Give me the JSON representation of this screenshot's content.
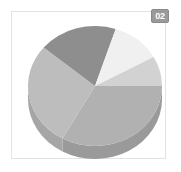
{
  "card": {
    "background_color": "#ffffff",
    "border_color": "#e3e3e3"
  },
  "badge": {
    "label": "02",
    "background_color": "#9a9a9a",
    "text_color": "#ffffff",
    "icon_name": "index-badge"
  },
  "chart_data": {
    "type": "pie",
    "title": "",
    "subtitle": "",
    "xlabel": "",
    "ylabel": "",
    "grid": false,
    "legend": false,
    "legend_position": "none",
    "three_d": true,
    "start_angle_deg": 0,
    "direction": "clockwise",
    "center_x": 95,
    "center_y": 86,
    "radius_x": 67,
    "radius_y": 60,
    "depth_px": 13,
    "categories": [
      "Segment A",
      "Segment B",
      "Segment C",
      "Segment D",
      "Segment E"
    ],
    "values": [
      33,
      28,
      19,
      12,
      8
    ],
    "percentages": [
      "33%",
      "28%",
      "19%",
      "12%",
      "8%"
    ],
    "colors": [
      "#b1b1b1",
      "#bdbdbd",
      "#8e8e8e",
      "#f0f0f0",
      "#d2d2d2"
    ],
    "side_colors": [
      "#9a9a9a",
      "#a6a6a6",
      "#7b7b7b",
      "#d4d4d4",
      "#b8b8b8"
    ],
    "slices": [
      {
        "label": "Segment A",
        "value": 33,
        "percent": "33%",
        "color": "#b1b1b1",
        "side_color": "#9a9a9a",
        "start_deg": 0,
        "end_deg": 119
      },
      {
        "label": "Segment B",
        "value": 28,
        "percent": "28%",
        "color": "#bdbdbd",
        "side_color": "#a6a6a6",
        "start_deg": 119,
        "end_deg": 220
      },
      {
        "label": "Segment C",
        "value": 19,
        "percent": "19%",
        "color": "#8e8e8e",
        "side_color": "#7b7b7b",
        "start_deg": 220,
        "end_deg": 288
      },
      {
        "label": "Segment D",
        "value": 12,
        "percent": "12%",
        "color": "#f0f0f0",
        "side_color": "#d4d4d4",
        "start_deg": 288,
        "end_deg": 331
      },
      {
        "label": "Segment E",
        "value": 8,
        "percent": "8%",
        "color": "#d2d2d2",
        "side_color": "#b8b8b8",
        "start_deg": 331,
        "end_deg": 360
      }
    ]
  }
}
